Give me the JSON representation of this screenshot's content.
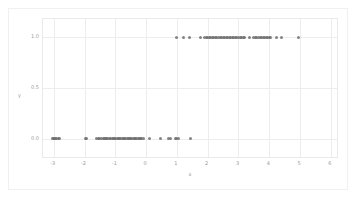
{
  "chart_data": {
    "type": "scatter",
    "title": "",
    "xlabel": "x",
    "ylabel": "y",
    "xlim": [
      -3.35,
      6.2
    ],
    "ylim": [
      -0.18,
      1.18
    ],
    "xticks": [
      -3,
      -2,
      -1,
      0,
      1,
      2,
      3,
      4,
      5,
      6
    ],
    "xtick_labels": [
      "-3",
      "-2",
      "-1",
      "0",
      "1",
      "2",
      "3",
      "4",
      "5",
      "6"
    ],
    "yticks": [
      0.0,
      0.5,
      1.0
    ],
    "ytick_labels": [
      "0.0",
      "0.5",
      "1.0"
    ],
    "grid": true,
    "legend": "none",
    "marker_color": "#6e6e6e",
    "grid_color": "#ededed",
    "background_color": "#ffffff",
    "series": [
      {
        "name": "observations",
        "x": [
          -3.05,
          -3.0,
          -2.97,
          -2.93,
          -2.9,
          -2.86,
          -2.82,
          -1.98,
          -1.94,
          -1.62,
          -1.55,
          -1.5,
          -1.45,
          -1.4,
          -1.36,
          -1.32,
          -1.28,
          -1.24,
          -1.2,
          -1.15,
          -1.1,
          -1.06,
          -1.02,
          -0.98,
          -0.94,
          -0.9,
          -0.86,
          -0.82,
          -0.78,
          -0.74,
          -0.7,
          -0.66,
          -0.62,
          -0.58,
          -0.54,
          -0.5,
          -0.46,
          -0.42,
          -0.38,
          -0.34,
          -0.3,
          -0.26,
          -0.22,
          -0.18,
          -0.14,
          -0.1,
          0.1,
          0.48,
          0.72,
          0.78,
          0.95,
          1.0,
          1.05,
          1.45
        ],
        "y": [
          0,
          0,
          0,
          0,
          0,
          0,
          0,
          0,
          0,
          0,
          0,
          0,
          0,
          0,
          0,
          0,
          0,
          0,
          0,
          0,
          0,
          0,
          0,
          0,
          0,
          0,
          0,
          0,
          0,
          0,
          0,
          0,
          0,
          0,
          0,
          0,
          0,
          0,
          0,
          0,
          0,
          0,
          0,
          0,
          0,
          0,
          0,
          0,
          0,
          0,
          0,
          0,
          0,
          0
        ]
      },
      {
        "name": "observations-upper",
        "x": [
          0.98,
          1.22,
          1.4,
          1.78,
          1.9,
          1.95,
          2.0,
          2.05,
          2.1,
          2.15,
          2.2,
          2.25,
          2.3,
          2.35,
          2.4,
          2.45,
          2.5,
          2.55,
          2.6,
          2.65,
          2.7,
          2.75,
          2.8,
          2.85,
          2.9,
          2.95,
          3.0,
          3.05,
          3.1,
          3.15,
          3.2,
          3.35,
          3.5,
          3.55,
          3.6,
          3.65,
          3.7,
          3.75,
          3.8,
          3.85,
          3.9,
          3.95,
          4.0,
          4.05,
          4.25,
          4.4,
          4.95
        ],
        "y": [
          1,
          1,
          1,
          1,
          1,
          1,
          1,
          1,
          1,
          1,
          1,
          1,
          1,
          1,
          1,
          1,
          1,
          1,
          1,
          1,
          1,
          1,
          1,
          1,
          1,
          1,
          1,
          1,
          1,
          1,
          1,
          1,
          1,
          1,
          1,
          1,
          1,
          1,
          1,
          1,
          1,
          1,
          1,
          1,
          1,
          1,
          1
        ]
      }
    ]
  }
}
